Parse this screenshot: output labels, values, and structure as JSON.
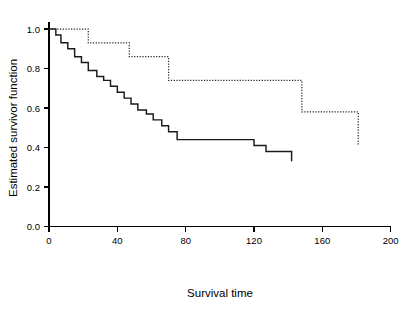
{
  "chart_data": {
    "type": "line",
    "title": "",
    "xlabel": "Survival time",
    "ylabel": "Estimated survivor function",
    "xlim": [
      0,
      200
    ],
    "ylim": [
      0.0,
      1.05
    ],
    "xticks": [
      0,
      40,
      80,
      120,
      160,
      200
    ],
    "yticks": [
      0.0,
      0.2,
      0.4,
      0.6,
      0.8,
      1.0
    ],
    "xticklabels": [
      "0",
      "40",
      "80",
      "120",
      "160",
      "200"
    ],
    "yticklabels": [
      "0.0",
      "0.2",
      "0.4",
      "0.6",
      "0.8",
      "1.0"
    ],
    "grid": false,
    "legend": null,
    "step_style": "post",
    "series": [
      {
        "name": "group-1-solid",
        "style": "solid",
        "color": "#1a1a1a",
        "x": [
          0,
          4,
          7,
          11,
          15,
          19,
          23,
          28,
          32,
          36,
          40,
          44,
          48,
          52,
          57,
          61,
          66,
          70,
          75,
          112,
          120,
          127,
          142
        ],
        "y": [
          1.0,
          0.97,
          0.93,
          0.9,
          0.86,
          0.83,
          0.79,
          0.76,
          0.74,
          0.71,
          0.68,
          0.65,
          0.62,
          0.59,
          0.57,
          0.54,
          0.51,
          0.48,
          0.44,
          0.44,
          0.41,
          0.38,
          0.33
        ],
        "final_x": 142,
        "final_y": 0.33
      },
      {
        "name": "group-2-dotted",
        "style": "dotted",
        "color": "#2b2b2b",
        "x": [
          0,
          23,
          47,
          70,
          148,
          181
        ],
        "y": [
          1.0,
          0.93,
          0.86,
          0.74,
          0.58,
          0.41
        ],
        "final_x": 181,
        "final_y": 0.41
      }
    ]
  },
  "figure": {
    "background_color": "#ffffff",
    "axis_color": "#000000"
  }
}
